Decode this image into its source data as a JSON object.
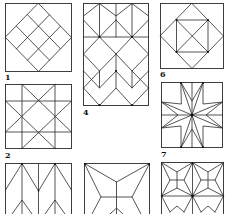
{
  "figure": {
    "background": "#ffffff",
    "line_color": "#2a2a2a",
    "panels": [
      {
        "id": "1",
        "label": "1",
        "description": "Square with inscribed diamond divided into 3x3 grid of small diamonds"
      },
      {
        "id": "2",
        "label": "2",
        "description": "Square with 3x3 grid and diagonal X lines forming diamond lattice"
      },
      {
        "id": "3",
        "label": "",
        "description": "Chevron / arrowhead stripes pattern (partially visible)"
      },
      {
        "id": "4",
        "label": "4",
        "description": "Tall rectangle with stacked cube / rhombus tessellation"
      },
      {
        "id": "5",
        "label": "",
        "description": "Square with radiating pinwheel lines from corners to inner cross (partially visible)"
      },
      {
        "id": "6",
        "label": "6",
        "description": "Square with inscribed diamond and inner square with diagonals"
      },
      {
        "id": "7",
        "label": "7",
        "description": "Square with eight-pointed star made of rhombuses"
      },
      {
        "id": "9",
        "label": "",
        "description": "Star and cross tessellation of four-pointed stars (partially visible)"
      }
    ]
  }
}
